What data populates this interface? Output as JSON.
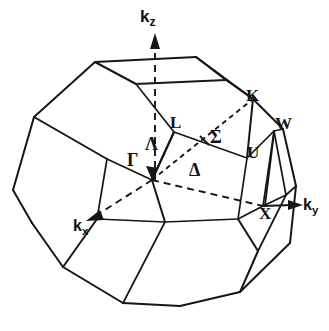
{
  "figure": {
    "background_color": "#ffffff",
    "line_color": "#161616"
  },
  "axes": [
    {
      "id": "kz",
      "base": "k",
      "sub": "z",
      "text": "kz",
      "style": "dashed-arrow-up"
    },
    {
      "id": "ky",
      "base": "k",
      "sub": "y",
      "text": "ky",
      "style": "solid-arrow-right"
    },
    {
      "id": "kx",
      "base": "k",
      "sub": "x",
      "text": "kx",
      "style": "dashed-arrow-down-left"
    }
  ],
  "high_symmetry_points": [
    {
      "label": "Γ",
      "name": "gamma",
      "x": 127,
      "y": 158
    },
    {
      "label": "L",
      "name": "l-point",
      "x": 172,
      "y": 123
    },
    {
      "label": "K",
      "name": "k-point",
      "x": 247,
      "y": 95
    },
    {
      "label": "W",
      "name": "w-point",
      "x": 277,
      "y": 123
    },
    {
      "label": "U",
      "name": "u-point",
      "x": 249,
      "y": 152
    },
    {
      "label": "X",
      "name": "x-point",
      "x": 263,
      "y": 203
    }
  ],
  "symmetry_lines": [
    {
      "label": "Λ",
      "name": "lambda-line",
      "from": "Γ",
      "to": "L",
      "x": 145,
      "y": 142,
      "style": "dashed"
    },
    {
      "label": "Σ",
      "name": "sigma-line",
      "from": "Γ",
      "to": "K",
      "x": 211,
      "y": 133,
      "style": "dashed"
    },
    {
      "label": "Δ",
      "name": "delta-line",
      "from": "Γ",
      "to": "X",
      "x": 191,
      "y": 168,
      "style": "dashed"
    }
  ],
  "labels": {
    "kz": "k",
    "kz_sub": "z",
    "ky": "k",
    "ky_sub": "y",
    "kx": "k",
    "kx_sub": "x",
    "gamma": "Γ",
    "lambda": "Λ",
    "l": "L",
    "sigma": "Σ",
    "k": "K",
    "w": "W",
    "u": "U",
    "delta": "Δ",
    "x": "X"
  }
}
